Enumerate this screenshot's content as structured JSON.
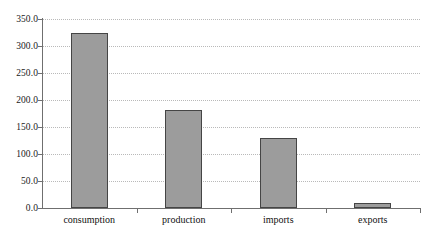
{
  "chart_data": {
    "type": "bar",
    "title": "",
    "subtitle": "",
    "xlabel": "",
    "ylabel": "",
    "categories": [
      "consumption",
      "production",
      "imports",
      "exports"
    ],
    "values": [
      325.0,
      182.0,
      129.0,
      9.0
    ],
    "ylim": [
      0.0,
      350.0
    ],
    "ytick_values": [
      0.0,
      50.0,
      100.0,
      150.0,
      200.0,
      250.0,
      300.0,
      350.0
    ],
    "ytick_labels": [
      "0.0",
      "50.0",
      "100.0",
      "150.0",
      "200.0",
      "250.0",
      "300.0",
      "350.0"
    ],
    "grid": true,
    "grid_axis": "y",
    "grid_style": "dotted",
    "legend": false,
    "legend_position": "none",
    "bar_fill_color": "#9c9c9c",
    "bar_border_color": "#454545",
    "gridline_color": "#b9b9b9",
    "axis_color": "#6f6f6f",
    "background_color": "#ffffff",
    "text_color": "#111111"
  }
}
